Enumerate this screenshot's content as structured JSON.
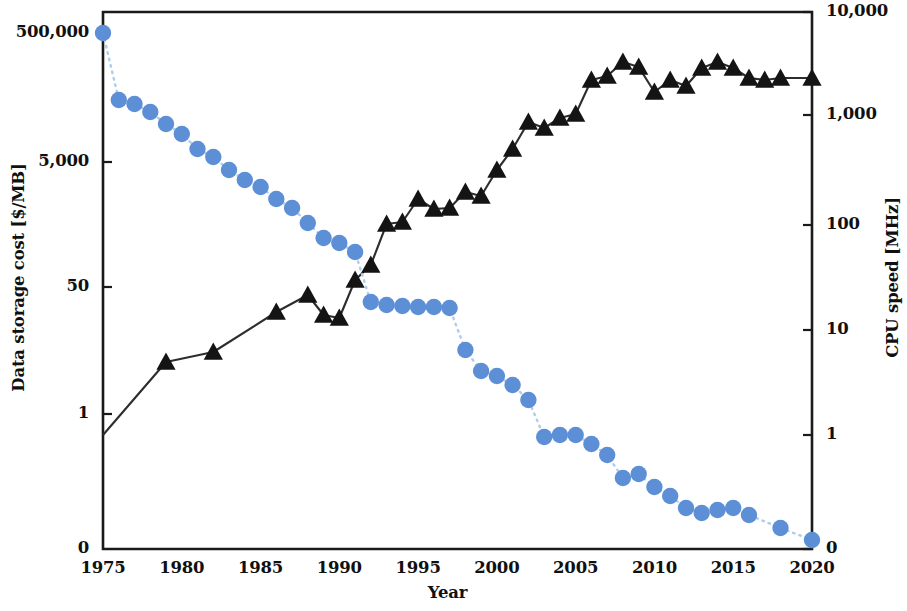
{
  "chart_data": {
    "type": "line",
    "title": "",
    "subtitle": "",
    "xlabel": "Year",
    "ylabel": "Data storage cost [$/MB]",
    "ylabel_right": "CPU speed [MHz]",
    "grid": false,
    "legend": "none",
    "xlim": [
      1975,
      2020
    ],
    "xticks": [
      "1975",
      "1980",
      "1985",
      "1990",
      "1995",
      "2000",
      "2005",
      "2010",
      "2015",
      "2020"
    ],
    "xtick_values": [
      1975,
      1980,
      1985,
      1990,
      1995,
      2000,
      2005,
      2010,
      2015,
      2020
    ],
    "yticks_left": [
      "0",
      "1",
      "50",
      "5,000",
      "500,000"
    ],
    "ytick_values_left": [
      0,
      1,
      50,
      5000,
      500000
    ],
    "ylim_left": [
      0,
      500000
    ],
    "yscale_left": "log-with-zero",
    "yticks_right": [
      "0",
      "1",
      "10",
      "100",
      "1,000",
      "10,000"
    ],
    "ytick_values_right": [
      0,
      1,
      10,
      100,
      1000,
      10000
    ],
    "ylim_right": [
      0,
      10000
    ],
    "yscale_right": "log-with-zero",
    "colors": {
      "storage_marker": "#5d8fd6",
      "storage_line": "#aecdec",
      "cpu_marker": "#141414",
      "cpu_line": "#2d2d2d",
      "axis": "#1a1a1a"
    },
    "series": [
      {
        "name": "Data storage cost",
        "axis": "left",
        "marker": "circle",
        "linestyle": "dotted",
        "x": [
          1975,
          1976,
          1977,
          1978,
          1979,
          1980,
          1981,
          1982,
          1983,
          1984,
          1985,
          1986,
          1987,
          1988,
          1989,
          1990,
          1991,
          1992,
          1993,
          1994,
          1995,
          1996,
          1997,
          1998,
          1999,
          2000,
          2001,
          2002,
          2003,
          2004,
          2005,
          2006,
          2007,
          2008,
          2009,
          2010,
          2011,
          2012,
          2013,
          2014,
          2015,
          2016,
          2018,
          2020
        ],
        "y_pixels": [
          33,
          100,
          104,
          112,
          124,
          134,
          149,
          157,
          170,
          180,
          187,
          199,
          208,
          223,
          238,
          243,
          252,
          302,
          305,
          306,
          307,
          307,
          308,
          350,
          371,
          376,
          385,
          400,
          437,
          435,
          435,
          444,
          455,
          478,
          474,
          487,
          496,
          508,
          513,
          510,
          508,
          515,
          528,
          540
        ],
        "y_values": [
          500000,
          17000,
          15500,
          13000,
          9500,
          7500,
          5200,
          4300,
          3100,
          2400,
          2000,
          1500,
          1150,
          730,
          470,
          400,
          320,
          52,
          49,
          48,
          47,
          47,
          46,
          13,
          6.5,
          5.6,
          4.3,
          3.0,
          1.0,
          1.05,
          1.05,
          0.85,
          0.63,
          0.33,
          0.37,
          0.25,
          0.19,
          0.12,
          0.1,
          0.11,
          0.12,
          0.09,
          0.05,
          0.02
        ]
      },
      {
        "name": "CPU speed",
        "axis": "right",
        "marker": "triangle",
        "linestyle": "solid",
        "x": [
          1979,
          1982,
          1986,
          1988,
          1989,
          1990,
          1991,
          1992,
          1993,
          1994,
          1995,
          1996,
          1997,
          1998,
          1999,
          2000,
          2001,
          2002,
          2003,
          2004,
          2005,
          2006,
          2007,
          2008,
          2009,
          2010,
          2011,
          2012,
          2013,
          2014,
          2015,
          2016,
          2017,
          2018,
          2020
        ],
        "y_pixels": [
          362,
          352,
          312,
          295,
          315,
          318,
          280,
          265,
          224,
          222,
          199,
          209,
          208,
          192,
          196,
          170,
          149,
          122,
          128,
          118,
          114,
          80,
          76,
          62,
          67,
          92,
          80,
          86,
          68,
          62,
          68,
          78,
          80,
          78,
          78
        ],
        "y_values": [
          5,
          6,
          16,
          25,
          14,
          13,
          33,
          50,
          150,
          160,
          250,
          210,
          215,
          300,
          275,
          600,
          1000,
          1400,
          1300,
          1700,
          1800,
          2600,
          3000,
          3300,
          3100,
          2300,
          2600,
          2400,
          2900,
          3200,
          2900,
          2650,
          2550,
          2650,
          2650
        ]
      }
    ]
  }
}
